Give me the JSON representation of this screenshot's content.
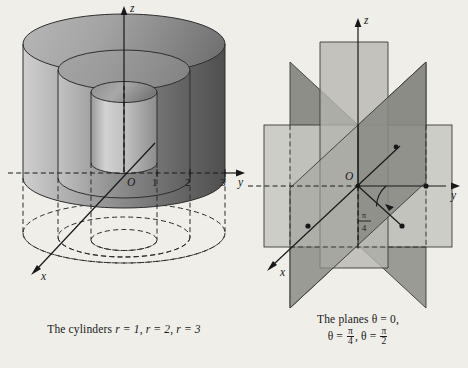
{
  "page": {
    "background_color": "#efeee9",
    "ink_color": "#18181a"
  },
  "figures": [
    {
      "id": "cylinders",
      "caption_prefix": "The cylinders ",
      "caption_items": [
        "r = 1",
        "r = 2",
        "r = 3"
      ],
      "caption_full": "The cylinders r = 1, r = 2, r = 3",
      "axes": {
        "z_label": "z",
        "y_label": "y",
        "x_label": "x",
        "origin_label": "O"
      },
      "tick_labels": [
        "1",
        "2",
        "3"
      ],
      "radii": [
        1,
        2,
        3
      ],
      "surface_colors": {
        "light": "#d9d9d9",
        "mid": "#a8a8a8",
        "dark": "#6e6e6e",
        "darkest": "#555555"
      }
    },
    {
      "id": "planes",
      "caption_line1": "The planes θ = 0,",
      "caption_line2_a": "θ = ",
      "caption_line2_b": ", θ = ",
      "fraction_1": {
        "num": "π",
        "den": "4"
      },
      "fraction_2": {
        "num": "π",
        "den": "2"
      },
      "caption_full": "The planes θ = 0, θ = π/4, θ = π/2",
      "axes": {
        "z_label": "z",
        "y_label": "y",
        "x_label": "x",
        "origin_label": "O"
      },
      "angle_label": {
        "num": "π",
        "den": "4"
      },
      "theta_values": [
        "0",
        "π/4",
        "π/2"
      ],
      "plane_colors": {
        "light": "#cfcfca",
        "mid": "#b3b3ae",
        "dark": "#9a9a95",
        "darker": "#858580"
      }
    }
  ]
}
